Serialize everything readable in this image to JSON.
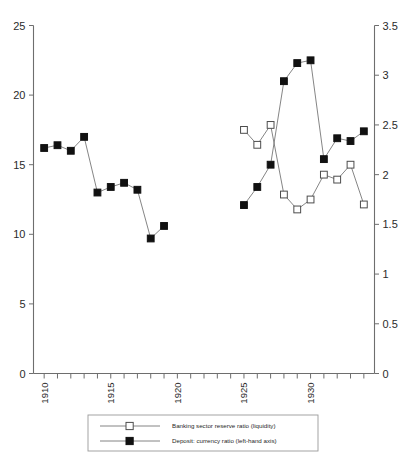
{
  "chart_data": {
    "type": "line",
    "title": "",
    "subtitle": "",
    "xlabel": "",
    "ylabel": "",
    "y2label": "",
    "xlim": [
      1909.2,
      1934.8
    ],
    "ylim": [
      0,
      25
    ],
    "y2lim": [
      0,
      3.5
    ],
    "grid": false,
    "legend_position": "bottom",
    "x_ticks_major": [
      1910,
      1915,
      1920,
      1925,
      1930
    ],
    "x_tick_labels": [
      "1910",
      "1915",
      "1920",
      "1925",
      "1930"
    ],
    "x_ticks_minor": [
      1911,
      1912,
      1913,
      1914,
      1916,
      1917,
      1918,
      1919,
      1921,
      1922,
      1923,
      1924,
      1926,
      1927,
      1928,
      1929,
      1931,
      1932,
      1933,
      1934
    ],
    "y_ticks": [
      0,
      5,
      10,
      15,
      20,
      25
    ],
    "y_tick_labels": [
      "0",
      "5",
      "10",
      "15",
      "20",
      "25"
    ],
    "y2_ticks": [
      0,
      0.5,
      1,
      1.5,
      2,
      2.5,
      3,
      3.5
    ],
    "y2_tick_labels": [
      "0",
      "0.5",
      "1",
      "1.5",
      "2",
      "2.5",
      "3",
      "3.5"
    ],
    "series": [
      {
        "name": "Banking sector reserve ratio (liquidity)",
        "marker": "open-square",
        "axis": "right",
        "segments": [
          {
            "x": [
              1910,
              1911,
              1912,
              1913,
              1914,
              1915,
              1916,
              1917,
              1918,
              1919
            ],
            "y": [
              4.5,
              4.3,
              4.3,
              4.3,
              9.4,
              10.0,
              15.3,
              18.5,
              23.2,
              18.2
            ]
          },
          {
            "x": [
              1925,
              1926,
              1927,
              1928,
              1929,
              1930,
              1931,
              1932,
              1933,
              1934
            ],
            "y": [
              2.45,
              2.3,
              2.5,
              1.8,
              1.65,
              1.75,
              2.0,
              1.95,
              2.1,
              1.7
            ]
          }
        ]
      },
      {
        "name": "Deposit: currency ratio (left-hand axis)",
        "marker": "filled-square",
        "axis": "left",
        "segments": [
          {
            "x": [
              1910,
              1911,
              1912,
              1913,
              1914,
              1915,
              1916,
              1917,
              1918,
              1919
            ],
            "y": [
              16.2,
              16.4,
              16.0,
              17.0,
              13.0,
              13.4,
              13.7,
              13.2,
              9.7,
              10.6
            ]
          },
          {
            "x": [
              1925,
              1926,
              1927,
              1928,
              1929,
              1930,
              1931,
              1932,
              1933,
              1934
            ],
            "y": [
              12.1,
              13.4,
              15.0,
              21.0,
              22.3,
              22.5,
              15.4,
              16.9,
              16.7,
              17.4
            ]
          }
        ]
      }
    ],
    "legend": [
      {
        "label": "Banking sector reserve ratio (liquidity)",
        "marker": "open-square"
      },
      {
        "label": "Deposit: currency ratio (left-hand axis)",
        "marker": "filled-square"
      }
    ]
  }
}
